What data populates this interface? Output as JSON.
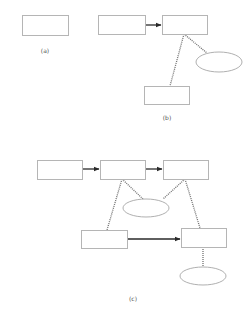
{
  "colors": {
    "box_stroke": "#b5b5b5",
    "ellipse_stroke": "#b0b0b0",
    "dotted_line": "#707070",
    "arrow": "#2a2a2a",
    "caption": "#555555",
    "background": "#ffffff"
  },
  "panels": [
    {
      "id": "a",
      "caption": "(a)",
      "caption_pos": [
        45,
        50
      ],
      "boxes": [
        {
          "id": "a-box-1",
          "x": 22,
          "y": 15,
          "w": 46,
          "h": 20
        }
      ],
      "ellipses": [],
      "arrows": [],
      "dotted_lines": []
    },
    {
      "id": "b",
      "caption": "(b)",
      "caption_pos": [
        167,
        117
      ],
      "boxes": [
        {
          "id": "b-box-left",
          "x": 98,
          "y": 15,
          "w": 47,
          "h": 19
        },
        {
          "id": "b-box-right",
          "x": 162,
          "y": 15,
          "w": 45,
          "h": 19
        },
        {
          "id": "b-box-bottom",
          "x": 144,
          "y": 86,
          "w": 45,
          "h": 18
        }
      ],
      "ellipses": [
        {
          "id": "b-ellipse",
          "cx": 219,
          "cy": 62,
          "rx": 23,
          "ry": 10
        }
      ],
      "arrows": [
        {
          "id": "b-arrow-1",
          "x1": 145,
          "y1": 25,
          "x2": 162,
          "y2": 25
        }
      ],
      "dotted_lines": [
        {
          "id": "b-link-box-bottom",
          "x1": 184,
          "y1": 34,
          "x2": 170,
          "y2": 86
        },
        {
          "id": "b-link-ellipse",
          "x1": 184,
          "y1": 34,
          "x2": 207,
          "y2": 53
        }
      ]
    },
    {
      "id": "c",
      "caption": "(c)",
      "caption_pos": [
        133,
        298
      ],
      "boxes": [
        {
          "id": "c-box-top-1",
          "x": 37,
          "y": 160,
          "w": 45,
          "h": 19
        },
        {
          "id": "c-box-top-2",
          "x": 100,
          "y": 160,
          "w": 45,
          "h": 19
        },
        {
          "id": "c-box-top-3",
          "x": 163,
          "y": 160,
          "w": 45,
          "h": 19
        },
        {
          "id": "c-box-bottom-left",
          "x": 81,
          "y": 230,
          "w": 46,
          "h": 18
        },
        {
          "id": "c-box-bottom-right",
          "x": 181,
          "y": 228,
          "w": 45,
          "h": 19
        }
      ],
      "ellipses": [
        {
          "id": "c-ellipse-middle",
          "cx": 146,
          "cy": 208,
          "rx": 23,
          "ry": 9
        },
        {
          "id": "c-ellipse-bottom",
          "cx": 203,
          "cy": 276,
          "rx": 23,
          "ry": 9
        }
      ],
      "arrows": [
        {
          "id": "c-arrow-1",
          "x1": 82,
          "y1": 169,
          "x2": 100,
          "y2": 169
        },
        {
          "id": "c-arrow-2",
          "x1": 145,
          "y1": 169,
          "x2": 163,
          "y2": 169
        },
        {
          "id": "c-arrow-3",
          "x1": 127,
          "y1": 239,
          "x2": 181,
          "y2": 239
        }
      ],
      "dotted_lines": [
        {
          "id": "c-link-2-ellipse",
          "x1": 122,
          "y1": 179,
          "x2": 143,
          "y2": 199
        },
        {
          "id": "c-link-2-bottom-left",
          "x1": 122,
          "y1": 179,
          "x2": 107,
          "y2": 230
        },
        {
          "id": "c-link-3-ellipse",
          "x1": 185,
          "y1": 179,
          "x2": 163,
          "y2": 199
        },
        {
          "id": "c-link-3-bottom-right",
          "x1": 185,
          "y1": 179,
          "x2": 200,
          "y2": 228
        },
        {
          "id": "c-link-bottom-right-ellipse",
          "x1": 203,
          "y1": 247,
          "x2": 203,
          "y2": 267
        }
      ]
    }
  ]
}
